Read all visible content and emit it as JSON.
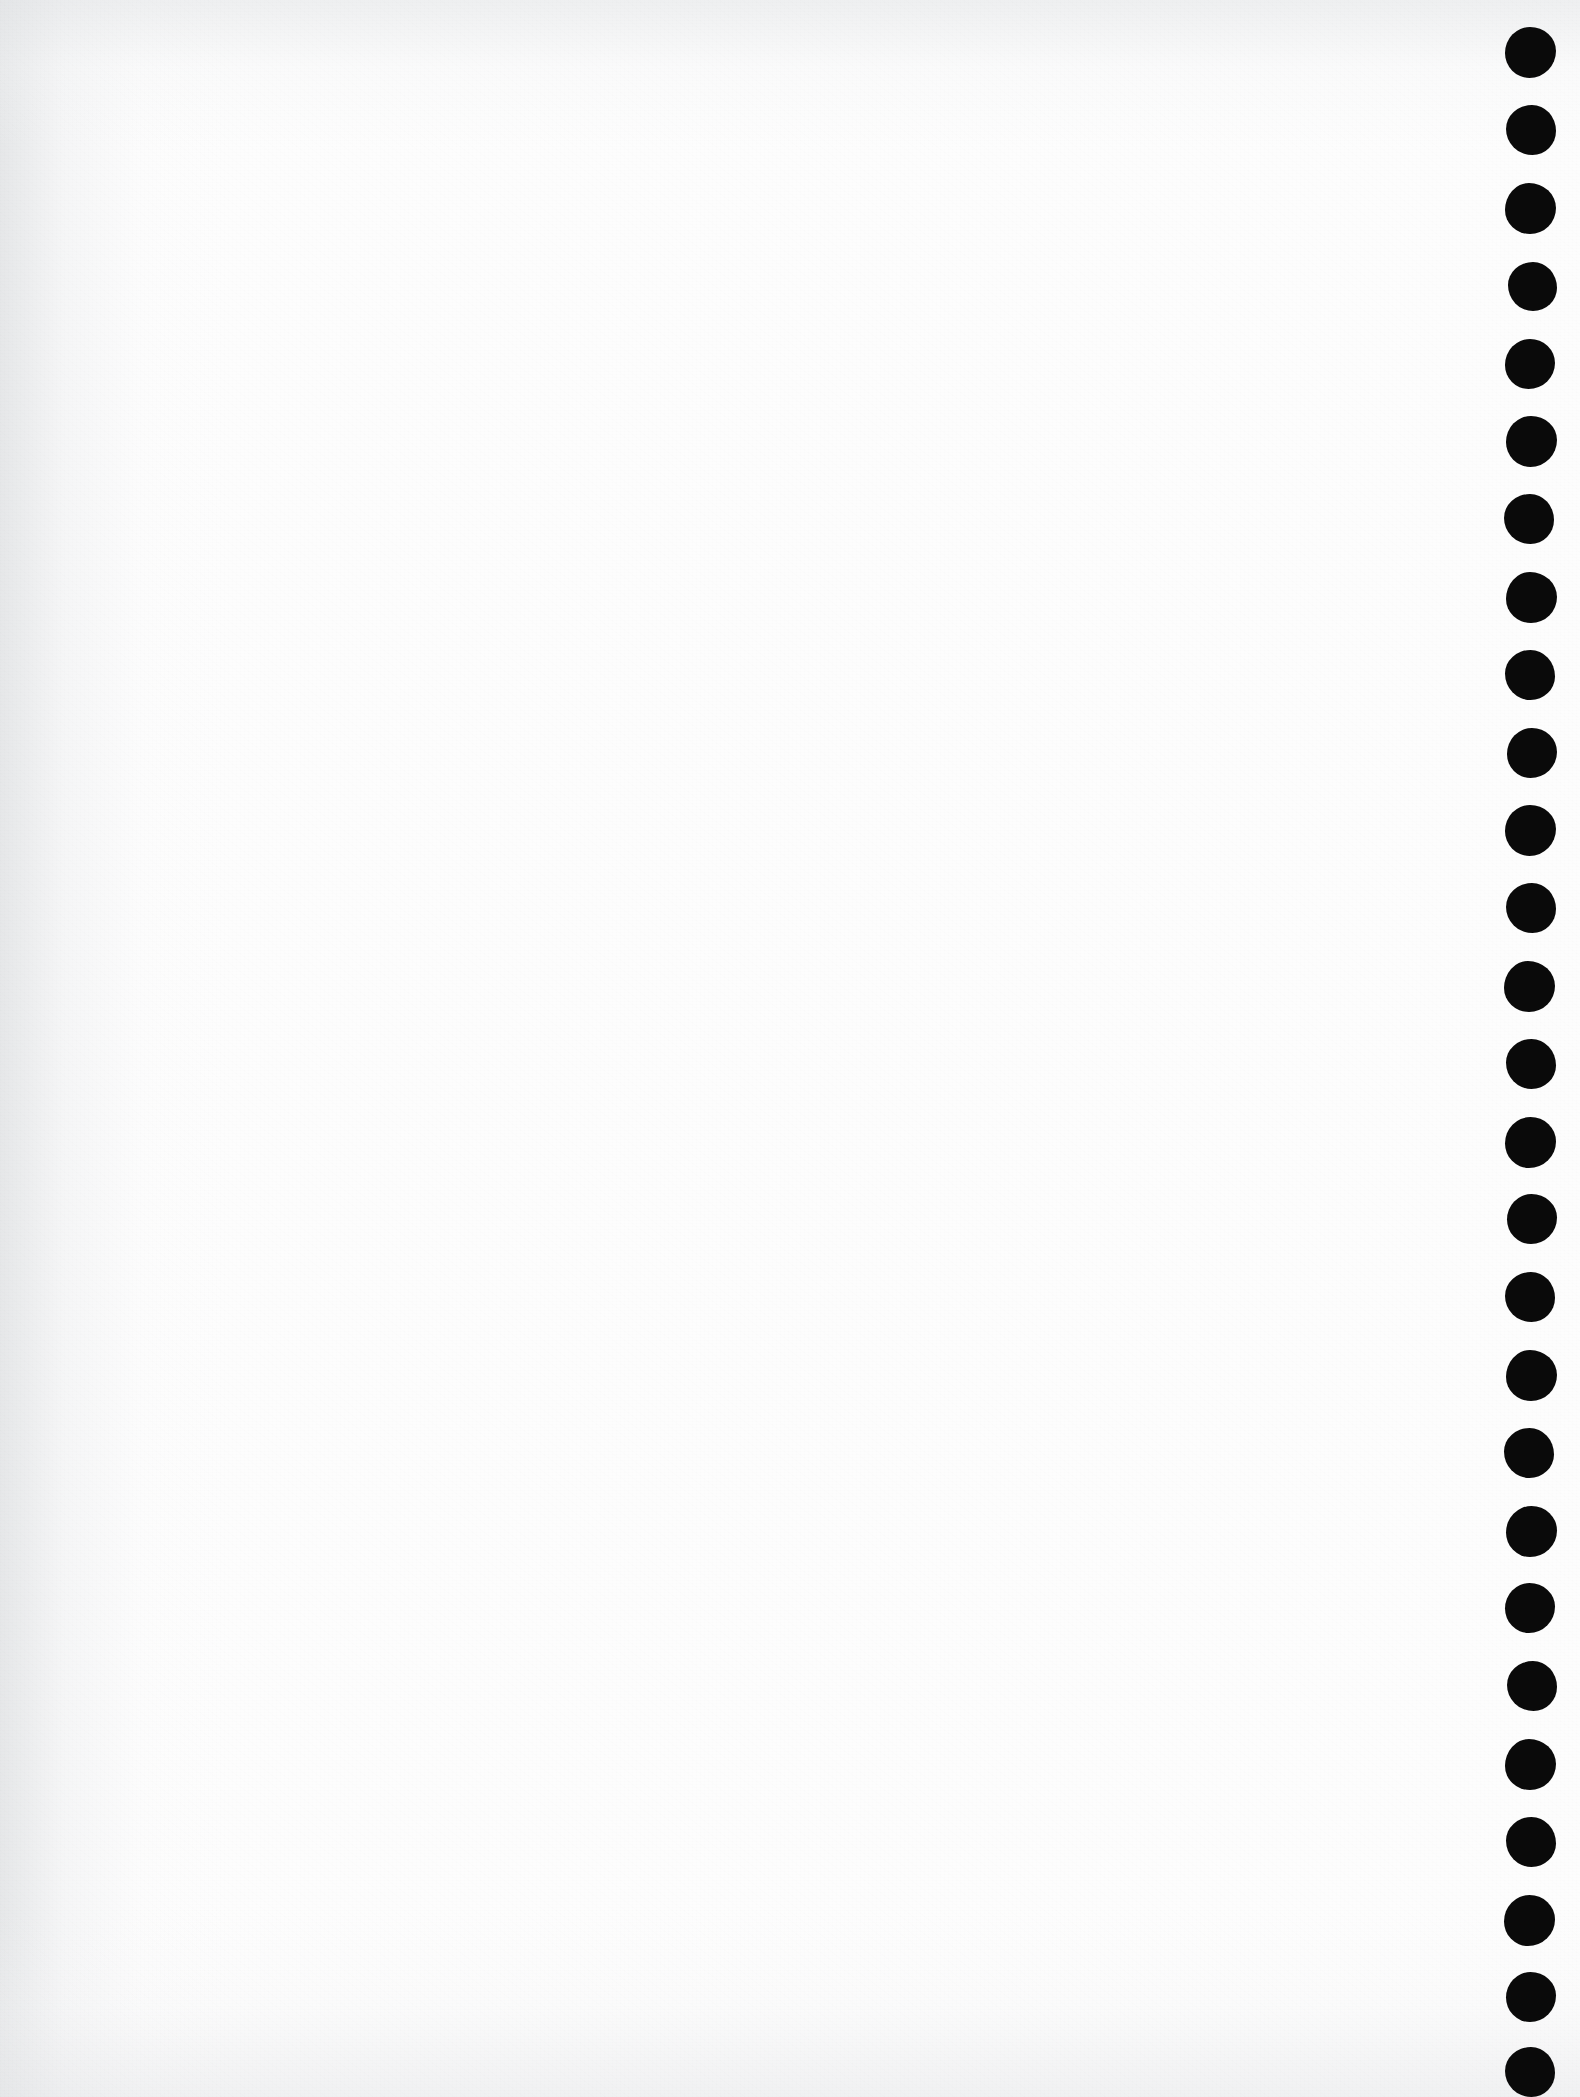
{
  "page": {
    "width": 1580,
    "height": 2097,
    "paper_color": "#fdfdfd",
    "ink_color": "#0a0a0a",
    "shade_color": "#e2e4e6",
    "orientation": "portrait",
    "content_description": "Blank off-white scanned paper; a single vertical column of solid black inked dots runs down the right margin."
  },
  "dot_column": {
    "name": "right-margin-dot-column",
    "count": 27,
    "center_x": 1530,
    "first_center_y": 52,
    "pitch_y": 78,
    "diameter": 50,
    "color": "#0a0a0a",
    "dots": [
      {
        "index": 1,
        "cx": 1530,
        "cy": 52,
        "d": 51,
        "shape": "blob-a"
      },
      {
        "index": 2,
        "cx": 1531,
        "cy": 130,
        "d": 50,
        "shape": "blob-b"
      },
      {
        "index": 3,
        "cx": 1530,
        "cy": 208,
        "d": 51,
        "shape": "blob-c"
      },
      {
        "index": 4,
        "cx": 1532,
        "cy": 286,
        "d": 49,
        "shape": "blob-d"
      },
      {
        "index": 5,
        "cx": 1530,
        "cy": 364,
        "d": 50,
        "shape": "blob-e"
      },
      {
        "index": 6,
        "cx": 1531,
        "cy": 441,
        "d": 51,
        "shape": "blob-a"
      },
      {
        "index": 7,
        "cx": 1529,
        "cy": 519,
        "d": 50,
        "shape": "blob-b"
      },
      {
        "index": 8,
        "cx": 1531,
        "cy": 597,
        "d": 51,
        "shape": "blob-c"
      },
      {
        "index": 9,
        "cx": 1530,
        "cy": 675,
        "d": 50,
        "shape": "blob-d"
      },
      {
        "index": 10,
        "cx": 1532,
        "cy": 753,
        "d": 50,
        "shape": "blob-e"
      },
      {
        "index": 11,
        "cx": 1530,
        "cy": 830,
        "d": 51,
        "shape": "blob-a"
      },
      {
        "index": 12,
        "cx": 1531,
        "cy": 908,
        "d": 50,
        "shape": "blob-b"
      },
      {
        "index": 13,
        "cx": 1529,
        "cy": 986,
        "d": 51,
        "shape": "blob-c"
      },
      {
        "index": 14,
        "cx": 1531,
        "cy": 1064,
        "d": 50,
        "shape": "blob-d"
      },
      {
        "index": 15,
        "cx": 1530,
        "cy": 1142,
        "d": 51,
        "shape": "blob-e"
      },
      {
        "index": 16,
        "cx": 1532,
        "cy": 1219,
        "d": 50,
        "shape": "blob-a"
      },
      {
        "index": 17,
        "cx": 1530,
        "cy": 1297,
        "d": 50,
        "shape": "blob-b"
      },
      {
        "index": 18,
        "cx": 1531,
        "cy": 1375,
        "d": 51,
        "shape": "blob-c"
      },
      {
        "index": 19,
        "cx": 1529,
        "cy": 1453,
        "d": 50,
        "shape": "blob-d"
      },
      {
        "index": 20,
        "cx": 1531,
        "cy": 1531,
        "d": 51,
        "shape": "blob-e"
      },
      {
        "index": 21,
        "cx": 1530,
        "cy": 1608,
        "d": 50,
        "shape": "blob-a"
      },
      {
        "index": 22,
        "cx": 1532,
        "cy": 1686,
        "d": 50,
        "shape": "blob-b"
      },
      {
        "index": 23,
        "cx": 1530,
        "cy": 1764,
        "d": 51,
        "shape": "blob-c"
      },
      {
        "index": 24,
        "cx": 1531,
        "cy": 1842,
        "d": 50,
        "shape": "blob-d"
      },
      {
        "index": 25,
        "cx": 1529,
        "cy": 1920,
        "d": 51,
        "shape": "blob-e"
      },
      {
        "index": 26,
        "cx": 1531,
        "cy": 1997,
        "d": 50,
        "shape": "blob-a"
      },
      {
        "index": 27,
        "cx": 1530,
        "cy": 2072,
        "d": 50,
        "shape": "blob-b"
      }
    ]
  }
}
